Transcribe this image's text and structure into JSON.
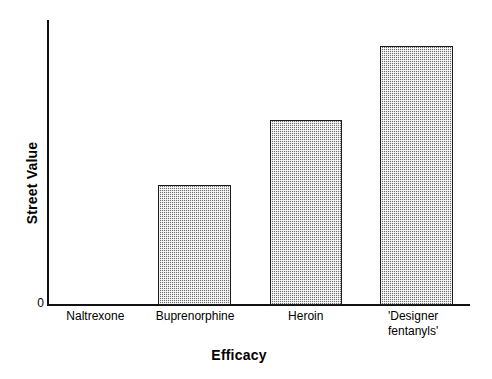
{
  "chart_data": {
    "type": "bar",
    "title": "",
    "subtitle": "",
    "xlabel": "Efficacy",
    "ylabel": "Street Value",
    "categories": [
      "Naltrexone",
      "Buprenorphine",
      "Heroin",
      "'Designer\nfentanyls'"
    ],
    "values": [
      0,
      42,
      65,
      91
    ],
    "ylim": [
      0,
      100
    ],
    "ytick_labels": [
      "0"
    ],
    "xtick_labels": [
      "Naltrexone",
      "Buprenorphine",
      "Heroin",
      "'Designer fentanyls'"
    ],
    "grid": false,
    "legend": false,
    "legend_position": "none",
    "annotations": [],
    "series": [
      {
        "name": "Street Value",
        "values": [
          0,
          42,
          65,
          91
        ]
      }
    ],
    "style": {
      "bar_fill": "#6e6e6e",
      "bar_fill_pattern": "fine-checkerboard-halftone",
      "bar_border": "#1a1a1a",
      "axis_color": "#111111",
      "background": "#ffffff"
    },
    "bar_geometry": [
      {
        "category": "Naltrexone",
        "left_pct": 0.0,
        "width_pct": 17.3,
        "height_pct": 0
      },
      {
        "category": "Buprenorphine",
        "left_pct": 25.9,
        "width_pct": 17.3,
        "height_pct": 42
      },
      {
        "category": "Heroin",
        "left_pct": 52.5,
        "width_pct": 17.1,
        "height_pct": 65
      },
      {
        "category": "'Designer fentanyls'",
        "left_pct": 78.6,
        "width_pct": 17.3,
        "height_pct": 91
      }
    ],
    "label_geometry": [
      {
        "center_pct": 11.0
      },
      {
        "center_pct": 34.7
      },
      {
        "center_pct": 61.0
      },
      {
        "center_pct": 86.5
      }
    ]
  }
}
